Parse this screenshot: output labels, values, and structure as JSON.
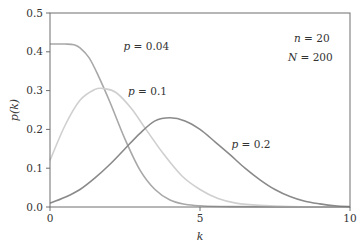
{
  "chart_data": {
    "type": "line",
    "title": "",
    "xlabel": "k",
    "ylabel": "p(k)",
    "xlim": [
      0,
      10
    ],
    "ylim": [
      0,
      0.5
    ],
    "xticks": [
      "0",
      "5",
      "10"
    ],
    "yticks": [
      "0.0",
      "0.1",
      "0.2",
      "0.3",
      "0.4",
      "0.5"
    ],
    "grid": false,
    "legend": "inline labels",
    "annotations": [
      {
        "text_var": "n",
        "text_val": "20"
      },
      {
        "text_var": "N",
        "text_val": "200"
      }
    ],
    "series": [
      {
        "name": "p = 0.04",
        "label_var": "p",
        "label_val": "0.04",
        "color": "#a8a8a8",
        "x": [
          0,
          0.5,
          0.8,
          1.0,
          1.3,
          1.6,
          2.0,
          2.5,
          3.0,
          3.5,
          4.0,
          4.5,
          5.0,
          6.0,
          10
        ],
        "y": [
          0.42,
          0.42,
          0.418,
          0.41,
          0.385,
          0.34,
          0.27,
          0.175,
          0.095,
          0.045,
          0.018,
          0.007,
          0.003,
          0.001,
          0.0
        ]
      },
      {
        "name": "p = 0.1",
        "label_var": "p",
        "label_val": "0.1",
        "color": "#cfcfcf",
        "x": [
          0,
          0.5,
          1.0,
          1.5,
          1.8,
          2.2,
          2.7,
          3.2,
          3.8,
          4.4,
          5.0,
          5.6,
          6.2,
          7.0,
          8.0,
          10
        ],
        "y": [
          0.12,
          0.21,
          0.275,
          0.303,
          0.305,
          0.295,
          0.255,
          0.2,
          0.135,
          0.08,
          0.045,
          0.022,
          0.01,
          0.004,
          0.001,
          0.0
        ]
      },
      {
        "name": "p = 0.2",
        "label_var": "p",
        "label_val": "0.2",
        "color": "#8a8a8a",
        "x": [
          0,
          0.5,
          1.0,
          1.5,
          2.0,
          2.5,
          3.0,
          3.5,
          4.0,
          4.5,
          5.0,
          5.5,
          6.0,
          6.5,
          7.0,
          7.5,
          8.0,
          8.5,
          9.0,
          9.5,
          10
        ],
        "y": [
          0.01,
          0.025,
          0.045,
          0.075,
          0.11,
          0.15,
          0.19,
          0.222,
          0.23,
          0.222,
          0.2,
          0.168,
          0.135,
          0.1,
          0.07,
          0.045,
          0.027,
          0.015,
          0.008,
          0.003,
          0.001
        ]
      }
    ],
    "series_labels_pos": [
      {
        "k": 2.45,
        "p": 0.405
      },
      {
        "k": 2.6,
        "p": 0.288
      },
      {
        "k": 6.05,
        "p": 0.152
      }
    ]
  }
}
